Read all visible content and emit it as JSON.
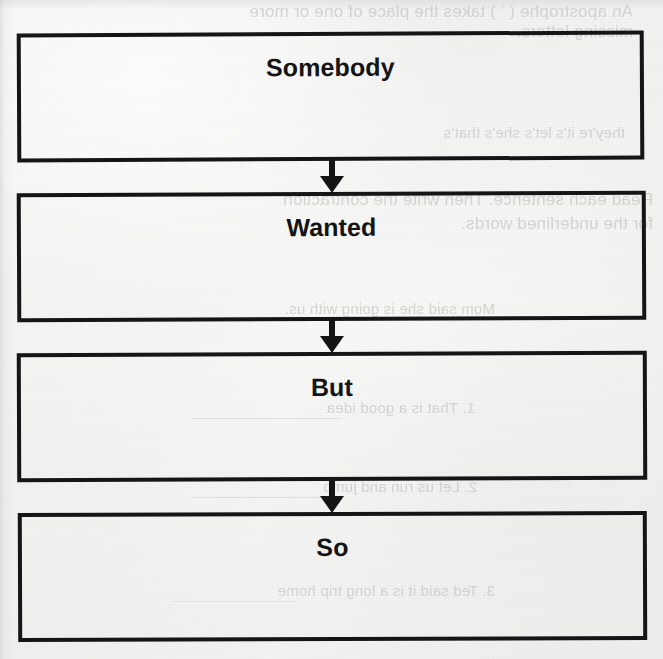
{
  "document": {
    "type": "scanned-worksheet",
    "organizer_name": "Somebody Wanted But So",
    "background_color": "#f2f2f1",
    "ink_color": "#141414"
  },
  "organizer": {
    "boxes": [
      {
        "label": "Somebody"
      },
      {
        "label": "Wanted"
      },
      {
        "label": "But"
      },
      {
        "label": "So"
      }
    ],
    "connectors": [
      {
        "name": "arrow-somebody-to-wanted",
        "glyph": "down-arrow"
      },
      {
        "name": "arrow-wanted-to-but",
        "glyph": "down-arrow"
      },
      {
        "name": "arrow-but-to-so",
        "glyph": "down-arrow"
      }
    ]
  },
  "bleedthrough": {
    "note": "Faint mirrored show-through text from the reverse side of the page",
    "lines": [
      "An apostrophe ( ' ) takes the place of one or more",
      "missing letters.",
      "they're          it's          let's          she's          that's",
      "Read each sentence. Then write the contraction",
      "for the underlined words.",
      "Mom said she is going with us.",
      "1.  That is a good idea",
      "2.  Let us run and jump",
      "3.  Ted said it is a long trip home"
    ]
  }
}
